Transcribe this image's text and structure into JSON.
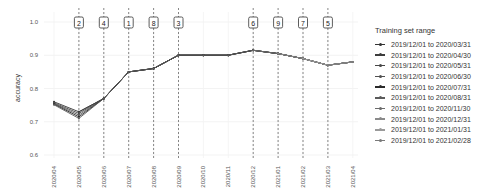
{
  "chart_data": {
    "type": "line",
    "title": "",
    "xlabel": "",
    "ylabel": "accuracy",
    "ylim": [
      0.6,
      1.0
    ],
    "yticks": [
      "0.6",
      "0.7",
      "0.8",
      "0.9",
      "1.0"
    ],
    "x": [
      "2020/04",
      "2020/05",
      "2020/06",
      "2020/07",
      "2020/08",
      "2020/09",
      "2020/10",
      "2020/11",
      "2020/12",
      "2021/01",
      "2021/02",
      "2021/03",
      "2021/04"
    ],
    "markers": [
      {
        "x": "2020/05",
        "label": "2"
      },
      {
        "x": "2020/06",
        "label": "4"
      },
      {
        "x": "2020/07",
        "label": "1"
      },
      {
        "x": "2020/08",
        "label": "8"
      },
      {
        "x": "2020/09",
        "label": "3"
      },
      {
        "x": "2020/12",
        "label": "6"
      },
      {
        "x": "2021/01",
        "label": "9"
      },
      {
        "x": "2021/02",
        "label": "7"
      },
      {
        "x": "2021/03",
        "label": "5"
      }
    ],
    "legend_title": "Training set range",
    "legend_position": "right",
    "grid": true,
    "series": [
      {
        "name": "2019/12/01 to 2020/03/31",
        "color": "#333333",
        "values": [
          0.76,
          0.73,
          0.77,
          0.85,
          0.86,
          0.9,
          0.9,
          0.9,
          0.915,
          0.905,
          0.89,
          0.87,
          0.88
        ]
      },
      {
        "name": "2019/12/01 to 2020/04/30",
        "color": "#3d3d3d",
        "values": [
          null,
          0.73,
          0.77,
          0.85,
          0.86,
          0.9,
          0.9,
          0.9,
          0.915,
          0.905,
          0.89,
          0.87,
          0.88
        ]
      },
      {
        "name": "2019/12/01 to 2020/05/31",
        "color": "#474747",
        "values": [
          0.757,
          0.725,
          0.77,
          0.85,
          0.86,
          0.9,
          0.9,
          0.9,
          0.915,
          0.905,
          0.89,
          0.87,
          0.88
        ]
      },
      {
        "name": "2019/12/01 to 2020/06/30",
        "color": "#515151",
        "values": [
          0.755,
          0.72,
          0.77,
          0.85,
          0.86,
          0.9,
          0.9,
          0.9,
          0.915,
          0.905,
          0.89,
          0.87,
          0.88
        ]
      },
      {
        "name": "2019/12/01 to 2020/07/31",
        "color": "#2a2a2a",
        "values": [
          0.753,
          0.715,
          0.77,
          0.85,
          0.86,
          0.9,
          0.9,
          0.9,
          0.915,
          0.905,
          0.89,
          0.87,
          0.88
        ]
      },
      {
        "name": "2019/12/01 to 2020/08/31",
        "color": "#5b5b5b",
        "values": [
          0.751,
          0.71,
          0.77,
          0.85,
          0.86,
          0.9,
          0.9,
          0.9,
          0.915,
          0.905,
          0.89,
          0.87,
          0.88
        ]
      },
      {
        "name": "2019/12/01 to 2020/11/30",
        "color": "#6a6a6a",
        "values": [
          null,
          null,
          null,
          null,
          null,
          null,
          null,
          null,
          0.915,
          0.905,
          0.89,
          0.87,
          0.88
        ]
      },
      {
        "name": "2019/12/01 to 2020/12/31",
        "color": "#8a8a8a",
        "values": [
          null,
          null,
          null,
          null,
          null,
          null,
          null,
          null,
          null,
          0.905,
          0.89,
          0.87,
          0.88
        ]
      },
      {
        "name": "2019/12/01 to 2021/01/31",
        "color": "#9a9a9a",
        "values": [
          null,
          null,
          null,
          null,
          null,
          null,
          null,
          null,
          null,
          null,
          0.89,
          0.87,
          0.88
        ]
      },
      {
        "name": "2019/12/01 to 2021/02/28",
        "color": "#7a7a7a",
        "values": [
          null,
          null,
          null,
          null,
          null,
          null,
          null,
          null,
          null,
          null,
          null,
          0.87,
          0.88
        ]
      }
    ]
  }
}
